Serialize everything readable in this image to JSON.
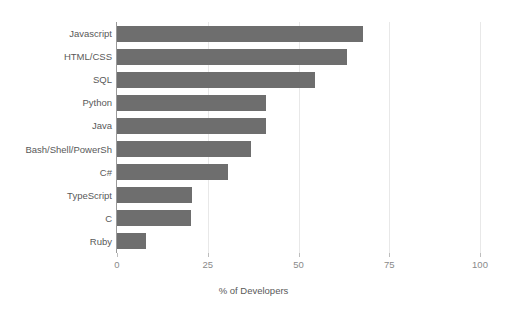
{
  "chart_data": {
    "type": "bar",
    "orientation": "horizontal",
    "title": "",
    "subtitle": "",
    "xlabel": "% of Developers",
    "ylabel": "",
    "categories": [
      "Javascript",
      "HTML/CSS",
      "SQL",
      "Python",
      "Java",
      "Bash/Shell/PowerSh",
      "C#",
      "TypeScript",
      "C",
      "Ruby"
    ],
    "values": [
      67.8,
      63.4,
      54.6,
      41.0,
      41.0,
      37.0,
      30.6,
      20.6,
      20.4,
      8.0
    ],
    "xlim": [
      0,
      100
    ],
    "xticks": [
      0,
      25,
      50,
      75,
      100
    ],
    "xtick_labels": [
      "0",
      "25",
      "50",
      "75",
      "100"
    ],
    "grid": "vertical",
    "legend": "none",
    "bar_color": "#6e6e6e",
    "gridline_color": "#e8e8e8",
    "axis_color": "#9a9a9a",
    "label_color": "#595959",
    "tick_label_color": "#8a8a8a",
    "background_color": "#ffffff"
  }
}
